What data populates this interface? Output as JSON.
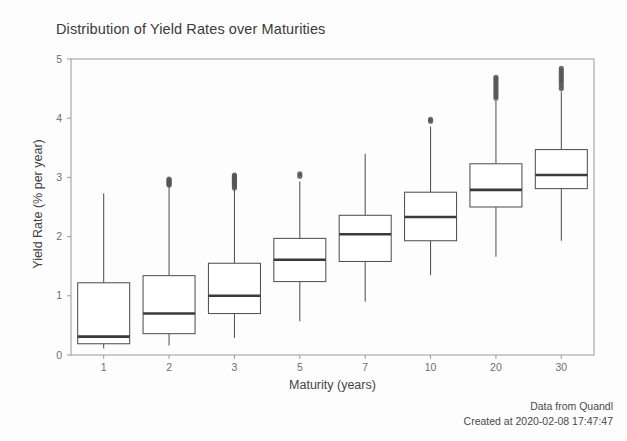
{
  "chart_data": {
    "type": "box",
    "title": "Distribution of Yield Rates over Maturities",
    "xlabel": "Maturity (years)",
    "ylabel": "Yield Rate (% per year)",
    "categories": [
      "1",
      "2",
      "3",
      "5",
      "7",
      "10",
      "20",
      "30"
    ],
    "ylim": [
      0,
      5
    ],
    "yticks": [
      0,
      1,
      2,
      3,
      4,
      5
    ],
    "ytick_labels": [
      "0",
      "1",
      "2",
      "3",
      "4",
      "5"
    ],
    "grid": false,
    "legend": "none",
    "boxes": [
      {
        "category": "1",
        "whisker_low": 0.11,
        "q1": 0.19,
        "median": 0.31,
        "q3": 1.22,
        "whisker_high": 2.73,
        "outliers": []
      },
      {
        "category": "2",
        "whisker_low": 0.16,
        "q1": 0.36,
        "median": 0.7,
        "q3": 1.34,
        "whisker_high": 2.85,
        "outliers": [
          2.87,
          2.89,
          2.91,
          2.93,
          2.95,
          2.97
        ]
      },
      {
        "category": "3",
        "whisker_low": 0.29,
        "q1": 0.7,
        "median": 1.0,
        "q3": 1.55,
        "whisker_high": 2.8,
        "outliers": [
          2.82,
          2.85,
          2.88,
          2.9,
          2.93,
          2.95,
          2.98,
          3.0,
          3.02,
          3.04
        ]
      },
      {
        "category": "5",
        "whisker_low": 0.57,
        "q1": 1.24,
        "median": 1.61,
        "q3": 1.97,
        "whisker_high": 2.93,
        "outliers": [
          3.02,
          3.06
        ]
      },
      {
        "category": "7",
        "whisker_low": 0.9,
        "q1": 1.58,
        "median": 2.04,
        "q3": 2.36,
        "whisker_high": 3.4,
        "outliers": []
      },
      {
        "category": "10",
        "whisker_low": 1.35,
        "q1": 1.93,
        "median": 2.33,
        "q3": 2.75,
        "whisker_high": 3.86,
        "outliers": [
          3.95,
          3.98
        ]
      },
      {
        "category": "20",
        "whisker_low": 1.66,
        "q1": 2.5,
        "median": 2.79,
        "q3": 3.23,
        "whisker_high": 4.3,
        "outliers": [
          4.34,
          4.38,
          4.42,
          4.46,
          4.5,
          4.54,
          4.58,
          4.62,
          4.66,
          4.69
        ]
      },
      {
        "category": "30",
        "whisker_low": 1.93,
        "q1": 2.81,
        "median": 3.04,
        "q3": 3.47,
        "whisker_high": 4.45,
        "outliers": [
          4.5,
          4.55,
          4.6,
          4.64,
          4.68,
          4.72,
          4.76,
          4.8,
          4.84
        ]
      }
    ]
  },
  "footer": {
    "source": "Data from Quandl",
    "created": "Created at 2020-02-08 17:47:47"
  },
  "colors": {
    "line": "#4a4a4a",
    "median": "#3a3a3a",
    "outlier": "#555555",
    "frame": "#9a9a9a",
    "background": "#fdfdfd"
  }
}
